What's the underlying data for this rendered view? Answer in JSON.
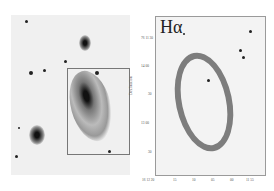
{
  "figure": {
    "left_panel": {
      "description": "Optical broad-band image of spiral galaxy with rectangular box marking region shown at right",
      "box_color": "#777777"
    },
    "right_panel": {
      "label": "Hα",
      "y_axis_title": "Declination",
      "y_ticks": [
        "76 11 30",
        "14 00",
        "30",
        "13 00",
        "30"
      ],
      "x_ticks": [
        "16 12 20",
        "15",
        "10",
        "05",
        "00",
        "11 55"
      ]
    }
  }
}
